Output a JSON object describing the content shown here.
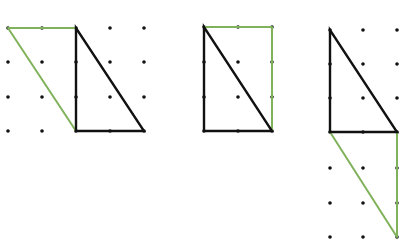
{
  "colors": {
    "background": "#ffffff",
    "dot": "#111111",
    "black_line": "#111111",
    "green_line": "#7fb25a"
  },
  "figures": [
    {
      "id": "figure-1",
      "dots": [
        [
          8,
          28
        ],
        [
          42,
          28
        ],
        [
          76,
          28
        ],
        [
          110,
          28
        ],
        [
          144,
          28
        ],
        [
          8,
          62
        ],
        [
          42,
          62
        ],
        [
          76,
          62
        ],
        [
          110,
          62
        ],
        [
          144,
          62
        ],
        [
          8,
          97
        ],
        [
          42,
          97
        ],
        [
          76,
          97
        ],
        [
          110,
          97
        ],
        [
          144,
          97
        ],
        [
          8,
          131
        ],
        [
          42,
          131
        ],
        [
          76,
          131
        ],
        [
          110,
          131
        ],
        [
          144,
          131
        ]
      ],
      "black_triangle": [
        [
          76,
          28
        ],
        [
          76,
          131
        ],
        [
          144,
          131
        ]
      ],
      "green_polyline": [
        [
          76,
          131
        ],
        [
          8,
          28
        ],
        [
          76,
          28
        ]
      ]
    },
    {
      "id": "figure-2",
      "dots": [
        [
          204,
          27
        ],
        [
          238,
          27
        ],
        [
          272,
          27
        ],
        [
          204,
          62
        ],
        [
          238,
          62
        ],
        [
          272,
          62
        ],
        [
          204,
          97
        ],
        [
          238,
          97
        ],
        [
          272,
          97
        ],
        [
          204,
          131
        ],
        [
          238,
          131
        ],
        [
          272,
          131
        ]
      ],
      "black_triangle": [
        [
          204,
          27
        ],
        [
          204,
          131
        ],
        [
          272,
          131
        ]
      ],
      "green_polyline": [
        [
          204,
          27
        ],
        [
          272,
          27
        ],
        [
          272,
          131
        ]
      ]
    },
    {
      "id": "figure-3",
      "dots": [
        [
          330,
          30
        ],
        [
          363,
          30
        ],
        [
          397,
          30
        ],
        [
          330,
          64
        ],
        [
          363,
          64
        ],
        [
          397,
          64
        ],
        [
          330,
          98
        ],
        [
          363,
          98
        ],
        [
          397,
          98
        ],
        [
          330,
          132
        ],
        [
          363,
          132
        ],
        [
          397,
          132
        ],
        [
          330,
          168
        ],
        [
          363,
          168
        ],
        [
          397,
          168
        ],
        [
          330,
          203
        ],
        [
          363,
          203
        ],
        [
          397,
          203
        ],
        [
          330,
          237
        ],
        [
          363,
          237
        ],
        [
          397,
          237
        ]
      ],
      "black_triangle": [
        [
          330,
          30
        ],
        [
          330,
          132
        ],
        [
          397,
          132
        ]
      ],
      "green_polyline": [
        [
          330,
          132
        ],
        [
          397,
          237
        ],
        [
          397,
          132
        ]
      ]
    }
  ]
}
